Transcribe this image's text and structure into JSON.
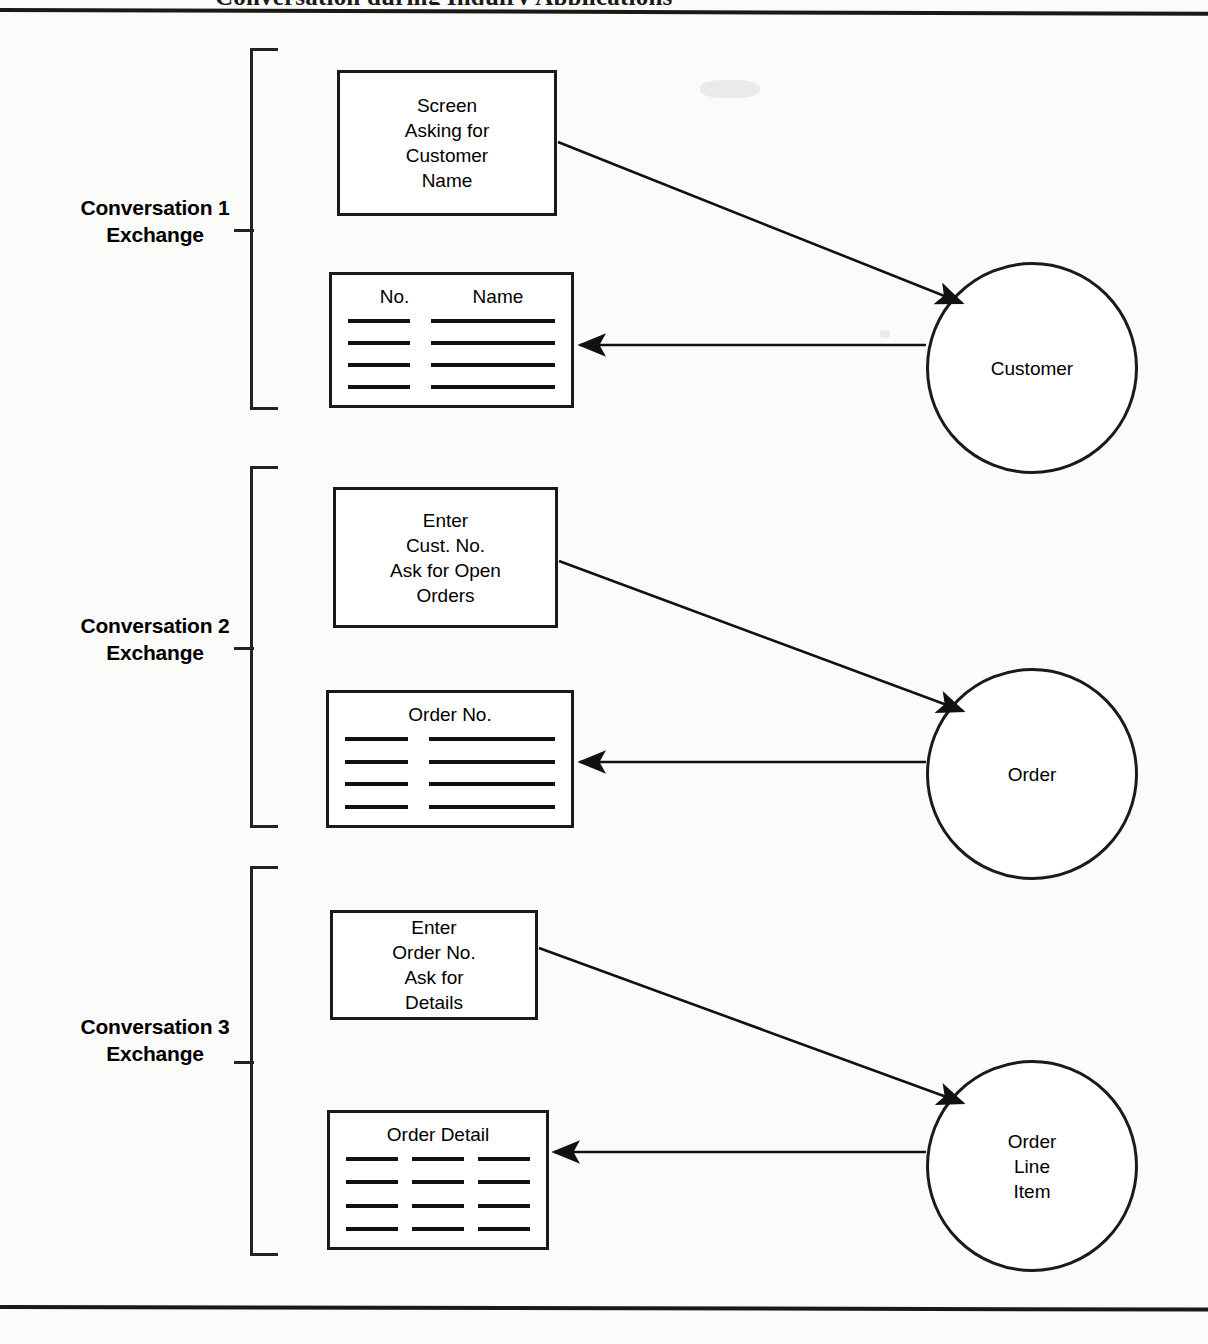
{
  "page": {
    "header_text": "Conversation during Inquiry Applications",
    "background_color": "#fbfbfa",
    "ink_color": "#1a1a1a"
  },
  "groups": [
    {
      "id": "conversation-1",
      "label_line1": "Conversation 1",
      "label_line2": "Exchange",
      "process_box": {
        "name": "screen-asking-for-customer-name",
        "text": "Screen\nAsking for\nCustomer\nName"
      },
      "report_box": {
        "name": "customer-list-report",
        "headers": [
          "No.",
          "Name"
        ],
        "columns": 2,
        "rows": 4,
        "header_centered": false
      },
      "entity": {
        "name": "customer-entity",
        "text": "Customer"
      }
    },
    {
      "id": "conversation-2",
      "label_line1": "Conversation 2",
      "label_line2": "Exchange",
      "process_box": {
        "name": "enter-cust-no-ask-for-open-orders",
        "text": "Enter\nCust. No.\nAsk for Open\nOrders"
      },
      "report_box": {
        "name": "order-no-report",
        "headers": [
          "Order No."
        ],
        "columns": 2,
        "rows": 4,
        "header_centered": true
      },
      "entity": {
        "name": "order-entity",
        "text": "Order"
      }
    },
    {
      "id": "conversation-3",
      "label_line1": "Conversation 3",
      "label_line2": "Exchange",
      "process_box": {
        "name": "enter-order-no-ask-for-details",
        "text": "Enter\nOrder No.\nAsk for\nDetails"
      },
      "report_box": {
        "name": "order-detail-report",
        "headers": [
          "Order Detail"
        ],
        "columns": 3,
        "rows": 4,
        "header_centered": true
      },
      "entity": {
        "name": "order-line-item-entity",
        "text": "Order\nLine\nItem"
      }
    }
  ]
}
